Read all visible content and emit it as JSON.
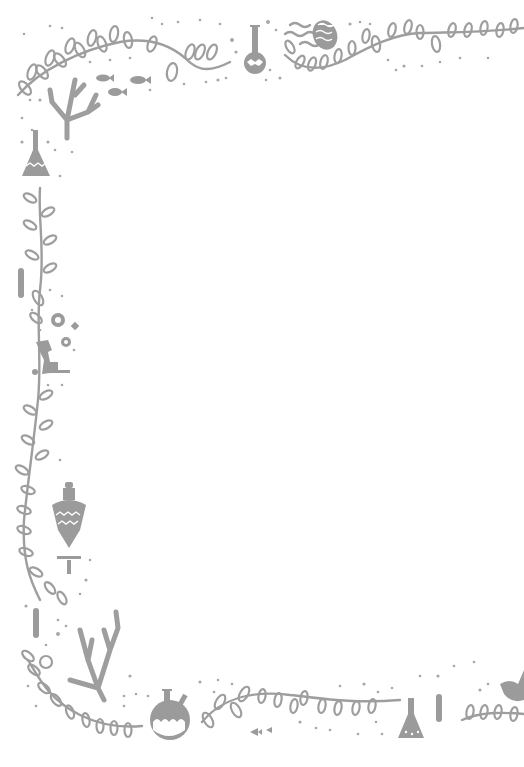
{
  "image": {
    "kind": "decorative-border-frame",
    "width": 524,
    "height": 767,
    "background_color": "#ffffff",
    "ink_color": "#9b9b9b",
    "center_content": "",
    "motifs": [
      {
        "name": "leafy-vine",
        "position": "top-left arc"
      },
      {
        "name": "round-flask",
        "position": "top center"
      },
      {
        "name": "wavy-lines",
        "position": "top center"
      },
      {
        "name": "patterned-egg",
        "position": "top center-right"
      },
      {
        "name": "leafy-vine",
        "position": "top right"
      },
      {
        "name": "fish",
        "count": 3,
        "position": "top-left inner"
      },
      {
        "name": "coral",
        "position": "top-left corner"
      },
      {
        "name": "erlenmeyer-flask",
        "position": "left upper"
      },
      {
        "name": "leafy-vine",
        "position": "left side"
      },
      {
        "name": "test-tube",
        "position": "left side"
      },
      {
        "name": "gears",
        "position": "left middle"
      },
      {
        "name": "microscope",
        "position": "left middle"
      },
      {
        "name": "potion-bottle",
        "position": "left lower"
      },
      {
        "name": "coral",
        "position": "bottom-left corner"
      },
      {
        "name": "two-neck-round-flask",
        "position": "bottom center-left"
      },
      {
        "name": "leafy-vine",
        "position": "bottom"
      },
      {
        "name": "fish",
        "count": 2,
        "position": "bottom center"
      },
      {
        "name": "erlenmeyer-flask",
        "position": "bottom center-right"
      },
      {
        "name": "test-tube",
        "position": "bottom center-right"
      },
      {
        "name": "bird",
        "position": "bottom right edge"
      }
    ]
  }
}
